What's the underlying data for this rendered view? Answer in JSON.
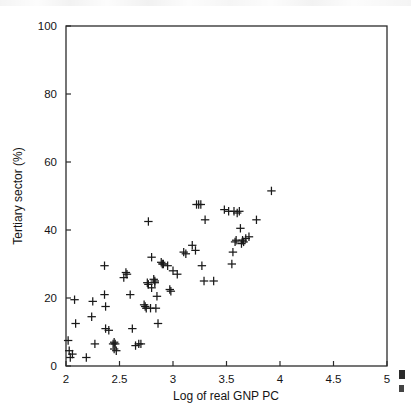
{
  "chart_data": {
    "type": "scatter",
    "title": "",
    "xlabel": "Log of real GNP PC",
    "ylabel": "Tertiary sector (%)",
    "xlim": [
      2,
      5
    ],
    "ylim": [
      0,
      100
    ],
    "xticks": [
      "2",
      "2.5",
      "3",
      "3.5",
      "4",
      "4.5",
      "5"
    ],
    "xtick_values": [
      2,
      2.5,
      3,
      3.5,
      4,
      4.5,
      5
    ],
    "yticks": [
      "0",
      "20",
      "40",
      "60",
      "80",
      "100"
    ],
    "ytick_values": [
      0,
      20,
      40,
      60,
      80,
      100
    ],
    "grid": false,
    "legend": null,
    "marker": "plus",
    "marker_color": "#1a1a1a",
    "frame": true,
    "points": [
      [
        2.02,
        7.5
      ],
      [
        2.03,
        4.5
      ],
      [
        2.04,
        2.5
      ],
      [
        2.06,
        3.5
      ],
      [
        2.08,
        19.5
      ],
      [
        2.09,
        12.5
      ],
      [
        2.19,
        2.5
      ],
      [
        2.24,
        14.5
      ],
      [
        2.25,
        19.0
      ],
      [
        2.27,
        6.5
      ],
      [
        2.36,
        21.0
      ],
      [
        2.36,
        29.5
      ],
      [
        2.37,
        17.5
      ],
      [
        2.37,
        11.0
      ],
      [
        2.4,
        10.5
      ],
      [
        2.44,
        6.5
      ],
      [
        2.45,
        7.0
      ],
      [
        2.45,
        5.0
      ],
      [
        2.46,
        6.5
      ],
      [
        2.47,
        4.5
      ],
      [
        2.54,
        26.0
      ],
      [
        2.56,
        27.5
      ],
      [
        2.57,
        27.0
      ],
      [
        2.6,
        21.0
      ],
      [
        2.62,
        11.0
      ],
      [
        2.65,
        6.0
      ],
      [
        2.68,
        6.5
      ],
      [
        2.7,
        6.5
      ],
      [
        2.73,
        18.0
      ],
      [
        2.74,
        17.5
      ],
      [
        2.75,
        17.0
      ],
      [
        2.76,
        24.5
      ],
      [
        2.77,
        24.0
      ],
      [
        2.77,
        42.5
      ],
      [
        2.79,
        17.0
      ],
      [
        2.8,
        23.0
      ],
      [
        2.8,
        32.0
      ],
      [
        2.82,
        25.5
      ],
      [
        2.83,
        24.5
      ],
      [
        2.83,
        25.0
      ],
      [
        2.84,
        17.0
      ],
      [
        2.85,
        20.5
      ],
      [
        2.86,
        12.5
      ],
      [
        2.89,
        30.5
      ],
      [
        2.9,
        30.0
      ],
      [
        2.91,
        30.0
      ],
      [
        2.95,
        29.5
      ],
      [
        2.97,
        22.5
      ],
      [
        2.98,
        22.0
      ],
      [
        3.0,
        28.0
      ],
      [
        3.04,
        27.0
      ],
      [
        3.1,
        33.5
      ],
      [
        3.12,
        33.0
      ],
      [
        3.18,
        35.5
      ],
      [
        3.21,
        34.0
      ],
      [
        3.22,
        47.5
      ],
      [
        3.24,
        47.5
      ],
      [
        3.26,
        47.5
      ],
      [
        3.27,
        29.5
      ],
      [
        3.29,
        25.0
      ],
      [
        3.3,
        43.0
      ],
      [
        3.38,
        25.0
      ],
      [
        3.48,
        46.0
      ],
      [
        3.52,
        45.5
      ],
      [
        3.55,
        30.0
      ],
      [
        3.56,
        33.5
      ],
      [
        3.57,
        45.5
      ],
      [
        3.58,
        36.5
      ],
      [
        3.59,
        37.0
      ],
      [
        3.6,
        45.0
      ],
      [
        3.62,
        45.5
      ],
      [
        3.63,
        40.5
      ],
      [
        3.64,
        36.0
      ],
      [
        3.65,
        37.0
      ],
      [
        3.66,
        36.5
      ],
      [
        3.68,
        37.5
      ],
      [
        3.71,
        38.0
      ],
      [
        3.78,
        43.0
      ],
      [
        3.92,
        51.5
      ]
    ],
    "n_points": 79
  }
}
